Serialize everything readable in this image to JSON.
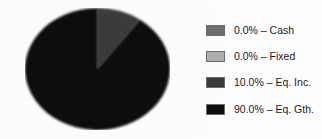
{
  "chart_data": {
    "type": "pie",
    "title": "",
    "subtitle": "",
    "xlabel": "",
    "ylabel": "",
    "grid": false,
    "legend_position": "right",
    "start_angle_deg": 90,
    "direction": "clockwise",
    "categories": [
      "Cash",
      "Fixed",
      "Eq. Inc.",
      "Eq. Gth."
    ],
    "values": [
      0.0,
      0.0,
      10.0,
      90.0
    ],
    "value_unit": "%",
    "slices": [
      {
        "label": "Cash",
        "percent": 0.0,
        "percent_text": "0.0%",
        "color": "#6e6e6e",
        "legend_text": "0.0% – Cash"
      },
      {
        "label": "Fixed",
        "percent": 0.0,
        "percent_text": "0.0%",
        "color": "#adadad",
        "legend_text": "0.0% – Fixed"
      },
      {
        "label": "Eq. Inc.",
        "percent": 10.0,
        "percent_text": "10.0%",
        "color": "#3a3a3a",
        "legend_text": "10.0% – Eq. Inc."
      },
      {
        "label": "Eq. Gth.",
        "percent": 90.0,
        "percent_text": "90.0%",
        "color": "#0e0e0e",
        "legend_text": "90.0% – Eq. Gth."
      }
    ]
  },
  "legend": {
    "rows": [
      {
        "swatch_name": "legend-swatch-cash",
        "text": "0.0% – Cash",
        "color": "#6e6e6e"
      },
      {
        "swatch_name": "legend-swatch-fixed",
        "text": "0.0% – Fixed",
        "color": "#adadad"
      },
      {
        "swatch_name": "legend-swatch-eq-inc",
        "text": "10.0% – Eq. Inc.",
        "color": "#3a3a3a"
      },
      {
        "swatch_name": "legend-swatch-eq-gth",
        "text": "90.0% – Eq. Gth.",
        "color": "#0e0e0e"
      }
    ]
  },
  "colors": {
    "background": "#fdfdfd",
    "swatch_border": "#6d6d6d",
    "text": "#1b1b1b"
  }
}
